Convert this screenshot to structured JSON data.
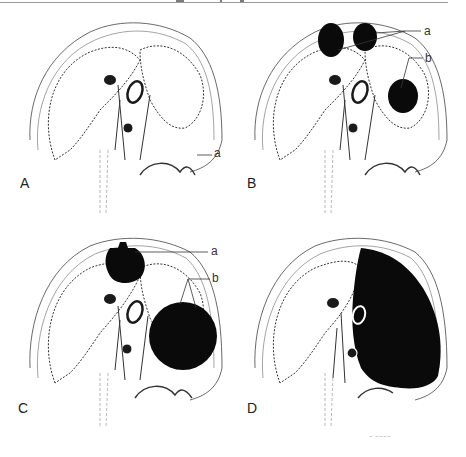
{
  "figure": {
    "panels": [
      {
        "id": "A",
        "label": "A",
        "callouts": [
          "a"
        ]
      },
      {
        "id": "B",
        "label": "B",
        "callouts": [
          "a",
          "b"
        ]
      },
      {
        "id": "C",
        "label": "C",
        "callouts": [
          "a",
          "b"
        ]
      },
      {
        "id": "D",
        "label": "D",
        "callouts": []
      }
    ],
    "colors": {
      "ink": "#1a1a1a",
      "paper": "#ffffff",
      "shade": "#555555",
      "rule": "#9a9a9a"
    }
  }
}
